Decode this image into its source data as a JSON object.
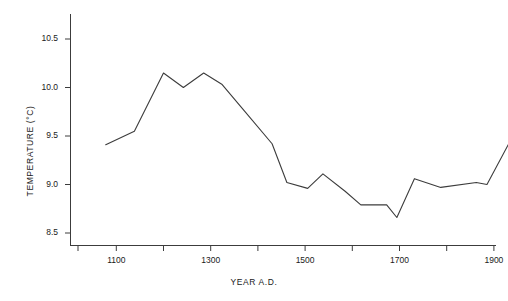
{
  "chart_data": {
    "type": "line",
    "title": "",
    "xlabel": "YEAR A.D.",
    "ylabel": "TEMPERATURE (°C)",
    "xlim": [
      1020,
      1960
    ],
    "ylim": [
      8.35,
      10.78
    ],
    "grid": false,
    "legend": false,
    "line_color": "#3c3c3c",
    "x": [
      1060,
      1120,
      1150,
      1185,
      1225,
      1270,
      1310,
      1360,
      1420,
      1460,
      1515,
      1560,
      1610,
      1660,
      1680,
      1725,
      1775,
      1820,
      1870,
      1930
    ],
    "values": [
      9.41,
      9.55,
      9.75,
      10.15,
      10.01,
      10.15,
      10.03,
      9.76,
      9.42,
      9.02,
      8.96,
      9.11,
      8.93,
      8.79,
      8.79,
      8.66,
      9.06,
      8.98,
      9.0,
      9.0
    ],
    "series": [
      {
        "name": "Temperature",
        "points": [
          {
            "x": 1060,
            "y": 9.41
          },
          {
            "x": 1122,
            "y": 9.55
          },
          {
            "x": 1185,
            "y": 10.15
          },
          {
            "x": 1228,
            "y": 10.0
          },
          {
            "x": 1272,
            "y": 10.15
          },
          {
            "x": 1312,
            "y": 10.03
          },
          {
            "x": 1360,
            "y": 9.76
          },
          {
            "x": 1420,
            "y": 9.42
          },
          {
            "x": 1452,
            "y": 9.02
          },
          {
            "x": 1497,
            "y": 8.96
          },
          {
            "x": 1530,
            "y": 9.11
          },
          {
            "x": 1578,
            "y": 8.93
          },
          {
            "x": 1612,
            "y": 8.79
          },
          {
            "x": 1668,
            "y": 8.79
          },
          {
            "x": 1690,
            "y": 8.66
          },
          {
            "x": 1728,
            "y": 9.06
          },
          {
            "x": 1785,
            "y": 8.97
          },
          {
            "x": 1862,
            "y": 9.02
          },
          {
            "x": 1885,
            "y": 9.0
          },
          {
            "x": 1932,
            "y": 9.42
          }
        ]
      }
    ],
    "x_ticks": [
      1100,
      1300,
      1500,
      1700,
      1900
    ],
    "x_tick_labels": [
      "1100",
      "1300",
      "1500",
      "1700",
      "1900"
    ],
    "x_minor_ticks": [
      1000,
      1200,
      1400,
      1600,
      1800
    ],
    "y_ticks": [
      8.5,
      9.0,
      9.5,
      10.0,
      10.5
    ],
    "y_tick_labels": [
      "8.5",
      "9.0",
      "9.5",
      "10.0",
      "10.5"
    ]
  }
}
